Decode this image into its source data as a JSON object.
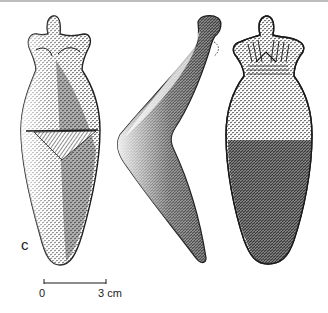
{
  "figure": {
    "panel_label": "c",
    "views": [
      {
        "name": "front-view",
        "description": "Figurine front view with incised line and chevron"
      },
      {
        "name": "side-view",
        "description": "Figurine profile view, bent"
      },
      {
        "name": "back-view",
        "description": "Figurine back view with striated shoulders"
      }
    ],
    "scale_bar": {
      "start_label": "0",
      "end_label": "3 cm"
    },
    "colors": {
      "ink": "#1a1a1a",
      "paper": "#ffffff",
      "top_rule": "#bdbdbd"
    }
  }
}
